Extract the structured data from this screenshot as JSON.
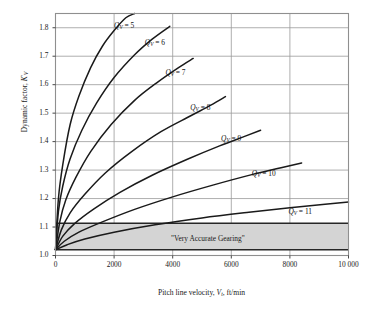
{
  "chart_data": {
    "type": "line",
    "title": "",
    "xlabel": "Pitch line velocity, V_t, ft/min",
    "ylabel": "Dynamic factor, K'_V",
    "xlim": [
      0,
      10000
    ],
    "ylim": [
      1.0,
      1.85
    ],
    "grid": true,
    "legend_position": "inline-curve-labels",
    "xticks": [
      0,
      2000,
      4000,
      6000,
      8000,
      10000
    ],
    "xtick_labels": [
      "0",
      "2000",
      "4000",
      "6000",
      "8000",
      "10 000"
    ],
    "yticks": [
      1.0,
      1.1,
      1.2,
      1.3,
      1.4,
      1.5,
      1.6,
      1.7,
      1.8
    ],
    "ytick_labels": [
      "1.0",
      "1.1",
      "1.2",
      "1.3",
      "1.4",
      "1.5",
      "1.6",
      "1.7",
      "1.8"
    ],
    "annotations": [
      {
        "text": "\"Very Accurate Gearing\"",
        "x": 5200,
        "y": 1.055
      }
    ],
    "shaded_region": {
      "label": "\"Very Accurate Gearing\"",
      "y_lower": 1.02,
      "y_upper": 1.113,
      "x_from": 0,
      "x_to": 10000,
      "fill": "#d4d4d4"
    },
    "series": [
      {
        "name": "Qv = 5",
        "label": "Q_V = 5",
        "label_x": 2000,
        "label_y": 1.805,
        "x": [
          0,
          100,
          250,
          500,
          800,
          1200,
          1600,
          2000,
          2400,
          2700
        ],
        "y": [
          1.02,
          1.2,
          1.32,
          1.46,
          1.56,
          1.66,
          1.735,
          1.79,
          1.835,
          1.85
        ]
      },
      {
        "name": "Qv = 6",
        "label": "Q_V = 6",
        "label_x": 3050,
        "label_y": 1.745,
        "x": [
          0,
          100,
          250,
          500,
          900,
          1400,
          2000,
          2700,
          3300,
          3900
        ],
        "y": [
          1.02,
          1.155,
          1.245,
          1.34,
          1.44,
          1.535,
          1.625,
          1.705,
          1.76,
          1.805
        ]
      },
      {
        "name": "Qv = 7",
        "label": "Q_V = 7",
        "label_x": 3750,
        "label_y": 1.638,
        "x": [
          0,
          150,
          350,
          700,
          1200,
          1900,
          2700,
          3500,
          4200,
          4700
        ],
        "y": [
          1.02,
          1.12,
          1.195,
          1.275,
          1.365,
          1.46,
          1.545,
          1.61,
          1.66,
          1.692
        ]
      },
      {
        "name": "Qv = 8",
        "label": "Q_V = 8",
        "label_x": 4600,
        "label_y": 1.518,
        "x": [
          0,
          200,
          500,
          1000,
          1700,
          2600,
          3600,
          4600,
          5300,
          5800
        ],
        "y": [
          1.02,
          1.09,
          1.15,
          1.215,
          1.29,
          1.365,
          1.435,
          1.49,
          1.528,
          1.558
        ]
      },
      {
        "name": "Qv = 9",
        "label": "Q_V = 9",
        "label_x": 5650,
        "label_y": 1.408,
        "x": [
          0,
          250,
          650,
          1300,
          2200,
          3300,
          4500,
          5600,
          6500,
          7000
        ],
        "y": [
          1.02,
          1.068,
          1.112,
          1.163,
          1.222,
          1.282,
          1.338,
          1.385,
          1.42,
          1.44
        ]
      },
      {
        "name": "Qv = 10",
        "label": "Q_V = 10",
        "label_x": 6700,
        "label_y": 1.285,
        "x": [
          0,
          300,
          800,
          1600,
          2700,
          4000,
          5400,
          6700,
          7700,
          8400
        ],
        "y": [
          1.02,
          1.05,
          1.082,
          1.118,
          1.162,
          1.206,
          1.248,
          1.284,
          1.308,
          1.325
        ]
      },
      {
        "name": "Qv = 11",
        "label": "Q_V = 11",
        "label_x": 7950,
        "label_y": 1.152,
        "x": [
          0,
          400,
          1000,
          2000,
          3400,
          5000,
          6600,
          8000,
          9200,
          10000
        ],
        "y": [
          1.02,
          1.038,
          1.058,
          1.082,
          1.108,
          1.132,
          1.152,
          1.168,
          1.18,
          1.188
        ]
      }
    ],
    "colors": {
      "curve": "#1a1a1a",
      "grid": "#9a9a9a",
      "frame": "#8f8f8f",
      "band_fill": "#d4d4d4",
      "band_edge": "#262626",
      "background": "#ffffff"
    }
  },
  "axis": {
    "ylabel_parts": {
      "text": "Dynamic factor, ",
      "symbol": "K",
      "prime": "'",
      "sub": "V"
    },
    "xlabel_parts": {
      "pre": "Pitch line velocity, ",
      "symbol": "V",
      "sub": "t",
      "post": ", ft/min"
    }
  }
}
